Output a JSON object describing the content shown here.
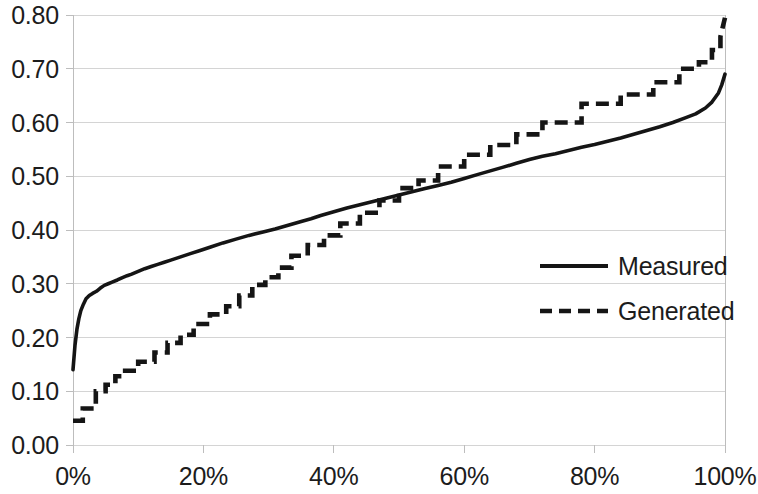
{
  "chart_data": {
    "type": "line",
    "title": "",
    "subtitle": "",
    "xlabel": "",
    "ylabel": "",
    "xlim": [
      0,
      100
    ],
    "ylim": [
      0,
      0.8
    ],
    "x_unit": "percent",
    "grid": true,
    "grid_axis": "y",
    "legend_position": "center-right",
    "x_tick_labels": [
      "0%",
      "20%",
      "40%",
      "60%",
      "80%",
      "100%"
    ],
    "x_tick_values": [
      0,
      20,
      40,
      60,
      80,
      100
    ],
    "y_tick_labels": [
      "0.00",
      "0.10",
      "0.20",
      "0.30",
      "0.40",
      "0.50",
      "0.60",
      "0.70",
      "0.80"
    ],
    "y_tick_values": [
      0.0,
      0.1,
      0.2,
      0.3,
      0.4,
      0.5,
      0.6,
      0.7,
      0.8
    ],
    "series": [
      {
        "name": "Measured",
        "style": "solid",
        "color": "#151515",
        "x": [
          0.0,
          0.3,
          0.6,
          0.9,
          1.2,
          1.6,
          2.0,
          2.5,
          3.0,
          3.6,
          4.2,
          4.8,
          5.4,
          6.0,
          6.8,
          7.5,
          8.3,
          9.0,
          10.0,
          11.0,
          12.0,
          13.0,
          14.0,
          15.0,
          16.5,
          18.0,
          19.5,
          21.0,
          23.0,
          25.0,
          27.0,
          29.0,
          31.0,
          33.0,
          35.0,
          36.5,
          38.0,
          40.0,
          42.0,
          44.0,
          46.0,
          48.0,
          50.0,
          52.0,
          54.0,
          56.0,
          58.0,
          60.0,
          62.0,
          64.0,
          66.0,
          68.0,
          70.0,
          72.0,
          74.0,
          76.0,
          78.0,
          80.0,
          82.0,
          84.0,
          86.0,
          88.0,
          90.0,
          92.0,
          94.0,
          95.5,
          97.0,
          98.0,
          99.0,
          99.5,
          100.0
        ],
        "y": [
          0.14,
          0.185,
          0.215,
          0.235,
          0.25,
          0.262,
          0.272,
          0.278,
          0.282,
          0.286,
          0.292,
          0.297,
          0.3,
          0.303,
          0.307,
          0.311,
          0.315,
          0.318,
          0.323,
          0.328,
          0.332,
          0.336,
          0.34,
          0.344,
          0.35,
          0.356,
          0.362,
          0.368,
          0.376,
          0.383,
          0.39,
          0.396,
          0.402,
          0.409,
          0.416,
          0.421,
          0.427,
          0.434,
          0.441,
          0.447,
          0.453,
          0.459,
          0.465,
          0.471,
          0.477,
          0.483,
          0.489,
          0.496,
          0.503,
          0.51,
          0.517,
          0.524,
          0.531,
          0.537,
          0.542,
          0.548,
          0.554,
          0.559,
          0.565,
          0.571,
          0.578,
          0.585,
          0.592,
          0.6,
          0.609,
          0.616,
          0.627,
          0.638,
          0.655,
          0.67,
          0.69
        ]
      },
      {
        "name": "Generated",
        "style": "dashed",
        "color": "#151515",
        "x": [
          0.0,
          1.5,
          1.5,
          3.5,
          3.5,
          5.0,
          5.0,
          6.5,
          6.5,
          8.0,
          8.0,
          10.0,
          10.0,
          12.5,
          12.5,
          14.5,
          14.5,
          16.5,
          16.5,
          18.5,
          18.5,
          21.0,
          21.0,
          23.5,
          23.5,
          25.5,
          25.5,
          27.5,
          27.5,
          29.5,
          29.5,
          31.5,
          31.5,
          33.5,
          33.5,
          36.0,
          36.0,
          38.5,
          38.5,
          41.0,
          41.0,
          44.0,
          44.0,
          47.0,
          47.0,
          50.0,
          50.0,
          53.0,
          53.0,
          56.0,
          56.0,
          60.0,
          60.0,
          64.0,
          64.0,
          68.0,
          68.0,
          72.0,
          72.0,
          78.0,
          78.0,
          84.0,
          84.0,
          89.0,
          89.0,
          93.0,
          93.0,
          96.0,
          96.0,
          98.0,
          98.0,
          99.3,
          99.3,
          100.0
        ],
        "y": [
          0.045,
          0.045,
          0.068,
          0.068,
          0.1,
          0.1,
          0.112,
          0.112,
          0.128,
          0.128,
          0.138,
          0.138,
          0.155,
          0.155,
          0.172,
          0.172,
          0.19,
          0.19,
          0.205,
          0.205,
          0.225,
          0.225,
          0.243,
          0.243,
          0.258,
          0.258,
          0.278,
          0.278,
          0.298,
          0.298,
          0.312,
          0.312,
          0.33,
          0.33,
          0.352,
          0.352,
          0.372,
          0.372,
          0.39,
          0.39,
          0.412,
          0.412,
          0.432,
          0.432,
          0.455,
          0.455,
          0.478,
          0.478,
          0.492,
          0.492,
          0.518,
          0.518,
          0.54,
          0.54,
          0.558,
          0.558,
          0.578,
          0.578,
          0.6,
          0.6,
          0.635,
          0.635,
          0.652,
          0.652,
          0.675,
          0.675,
          0.7,
          0.7,
          0.712,
          0.712,
          0.735,
          0.735,
          0.76,
          0.795
        ]
      }
    ]
  },
  "legend": {
    "items": [
      {
        "label": "Measured",
        "style": "solid"
      },
      {
        "label": "Generated",
        "style": "dashed"
      }
    ]
  }
}
